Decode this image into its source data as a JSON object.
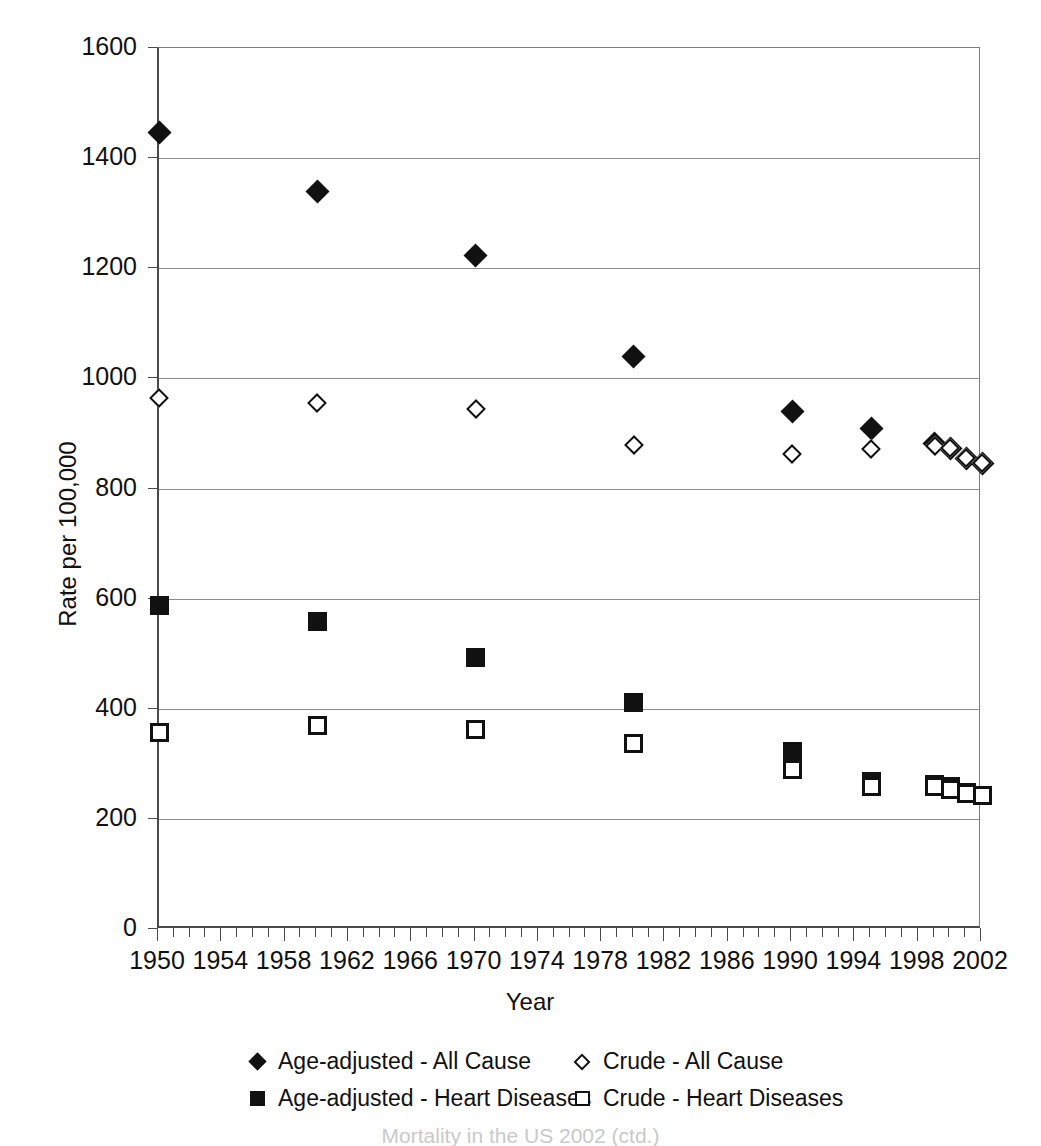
{
  "chart_data": {
    "type": "scatter",
    "title": "",
    "xlabel": "Year",
    "ylabel": "Rate per 100,000",
    "xlim": [
      1950,
      2002
    ],
    "ylim": [
      0,
      1600
    ],
    "ytick_labels": [
      "0",
      "200",
      "400",
      "600",
      "800",
      "1000",
      "1200",
      "1400",
      "1600"
    ],
    "ytick_values": [
      0,
      200,
      400,
      600,
      800,
      1000,
      1200,
      1400,
      1600
    ],
    "xtick_labels": [
      "1950",
      "1954",
      "1958",
      "1962",
      "1966",
      "1970",
      "1974",
      "1978",
      "1982",
      "1986",
      "1990",
      "1994",
      "1998",
      "2002"
    ],
    "xtick_values": [
      1950,
      1954,
      1958,
      1962,
      1966,
      1970,
      1974,
      1978,
      1982,
      1986,
      1990,
      1994,
      1998,
      2002
    ],
    "minor_xtick_interval": 1,
    "grid": "horizontal",
    "legend_position": "bottom",
    "x": [
      1950,
      1960,
      1970,
      1980,
      1990,
      1995,
      1999,
      2000,
      2001,
      2002
    ],
    "series": [
      {
        "name": "Age-adjusted - All Cause",
        "marker": "diamond-filled",
        "values": [
          1446,
          1339,
          1223,
          1039,
          939,
          909,
          882,
          872,
          855,
          846
        ]
      },
      {
        "name": "Crude - All Cause",
        "marker": "diamond-open",
        "values": [
          964,
          955,
          945,
          879,
          863,
          872,
          877,
          873,
          855,
          847
        ]
      },
      {
        "name": "Age-adjusted - Heart Diseases",
        "marker": "square-filled",
        "values": [
          587,
          559,
          493,
          412,
          322,
          268,
          263,
          258,
          248,
          242
        ]
      },
      {
        "name": "Crude - Heart Diseases",
        "marker": "square-open",
        "values": [
          356,
          369,
          362,
          336,
          290,
          258,
          258,
          253,
          246,
          242
        ]
      }
    ]
  },
  "legend": {
    "rows": [
      [
        {
          "marker": "diamond-filled",
          "label": "Age-adjusted - All Cause"
        },
        {
          "marker": "diamond-open",
          "label": "Crude - All Cause"
        }
      ],
      [
        {
          "marker": "square-filled",
          "label": "Age-adjusted - Heart Diseases"
        },
        {
          "marker": "square-open",
          "label": "Crude - Heart Diseases"
        }
      ]
    ]
  },
  "caption": {
    "text": "Mortality in the US 2002 (ctd.)"
  },
  "colors": {
    "marker": "#111111",
    "axis": "#4a4a4a",
    "gridline": "#8d8d8d",
    "background": "#ffffff"
  }
}
